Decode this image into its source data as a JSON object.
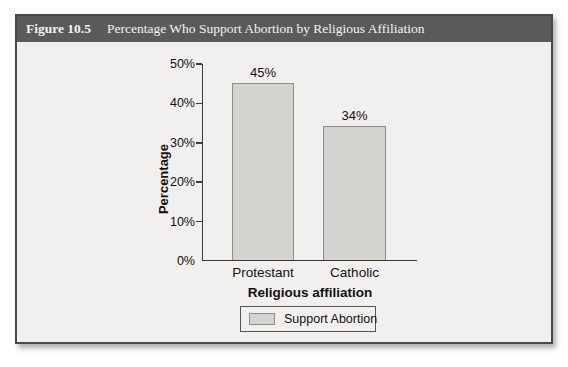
{
  "figure": {
    "label": "Figure 10.5",
    "title": "Percentage Who Support Abortion by Religious Affiliation"
  },
  "chart_data": {
    "type": "bar",
    "categories": [
      "Protestant",
      "Catholic"
    ],
    "values": [
      45,
      34
    ],
    "value_labels": [
      "45%",
      "34%"
    ],
    "title": "Percentage Who Support Abortion by Religious Affiliation",
    "xlabel": "Religious affiliation",
    "ylabel": "Percentage",
    "ylim": [
      0,
      50
    ],
    "yticks": [
      0,
      10,
      20,
      30,
      40,
      50
    ],
    "ytick_labels": [
      "0%",
      "10%",
      "20%",
      "30%",
      "40%",
      "50%"
    ],
    "grid": false,
    "legend": {
      "position": "bottom",
      "entries": [
        "Support Abortion"
      ]
    }
  },
  "colors": {
    "header_bg": "#5a5a5a",
    "header_text": "#f6f4f0",
    "card_bg": "#f1f0ee",
    "card_border": "#4a4a4a",
    "bar_fill": "#d4d3d0",
    "bar_border": "#8c8c8a",
    "axis": "#3c3c3c",
    "text": "#111111"
  }
}
